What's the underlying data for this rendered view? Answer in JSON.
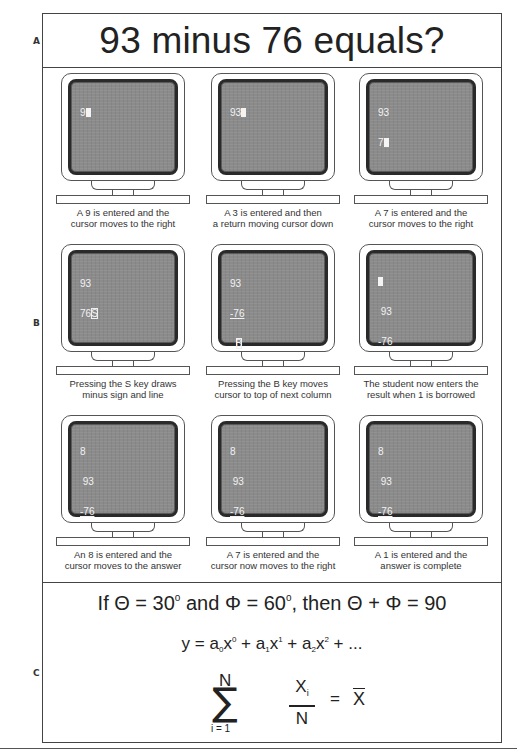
{
  "section_labels": {
    "a": "A",
    "b": "B",
    "c": "C"
  },
  "title": "93 minus 76 equals?",
  "steps": [
    {
      "screen_lines": [
        [
          "9",
          "cursor"
        ]
      ],
      "caption_line1": "A 9 is entered and the",
      "caption_line2": "cursor moves to the right"
    },
    {
      "screen_lines": [
        [
          "93",
          "cursor"
        ]
      ],
      "caption_line1": "A 3 is entered and then",
      "caption_line2": "a return moving cursor down"
    },
    {
      "screen_lines": [
        [
          "93"
        ],
        [
          "7",
          "cursor"
        ]
      ],
      "caption_line1": "A 7 is entered and the",
      "caption_line2": "cursor moves to the right"
    },
    {
      "screen_lines": [
        [
          "93"
        ],
        [
          "76",
          "S-boxed"
        ]
      ],
      "caption_line1": "Pressing the S key draws",
      "caption_line2": "minus sign and line"
    },
    {
      "screen_lines": [
        [
          "93"
        ],
        [
          "-76"
        ],
        [
          " ",
          "B-boxed"
        ]
      ],
      "caption_line1": "Pressing the B key moves",
      "caption_line2": "cursor to top of next column"
    },
    {
      "screen_lines": [
        [
          "cursor"
        ],
        [
          " 93"
        ],
        [
          "-76"
        ]
      ],
      "caption_line1": "The student now enters the",
      "caption_line2": "result when 1 is borrowed"
    },
    {
      "screen_lines": [
        [
          "8"
        ],
        [
          " 93"
        ],
        [
          "-76"
        ],
        [
          " ",
          "cursor"
        ]
      ],
      "caption_line1": "An 8 is entered and the",
      "caption_line2": "cursor moves to the answer"
    },
    {
      "screen_lines": [
        [
          "8"
        ],
        [
          " 93"
        ],
        [
          "-76"
        ],
        [
          "cursor",
          "7"
        ]
      ],
      "caption_line1": "A 7 is entered and the",
      "caption_line2": "cursor now moves to the right"
    },
    {
      "screen_lines": [
        [
          "8"
        ],
        [
          " 93"
        ],
        [
          "-76"
        ],
        [
          "cursor",
          "17"
        ]
      ],
      "caption_line1": "A 1 is entered and the",
      "caption_line2": "answer is complete"
    }
  ],
  "formulas": {
    "eq1": {
      "part1": "If Θ = 30",
      "deg1": "o",
      "part2": " and Φ = 60",
      "deg2": "o",
      "part3": ", then Θ + Φ = 90"
    },
    "eq2": {
      "y": "y = a",
      "s0": "0",
      "x0": "x",
      "p0": "0",
      "plus1": " + a",
      "s1": "1",
      "x1": "x",
      "p1": "1",
      "plus2": " + a",
      "s2": "2",
      "x2": "x",
      "p2": "2",
      "tail": " + ..."
    },
    "eq3": {
      "upper": "N",
      "sigma": "∑",
      "lower": "i = 1",
      "num": "X",
      "num_sub": "i",
      "den": "N",
      "equals": "=",
      "result": "X"
    }
  }
}
